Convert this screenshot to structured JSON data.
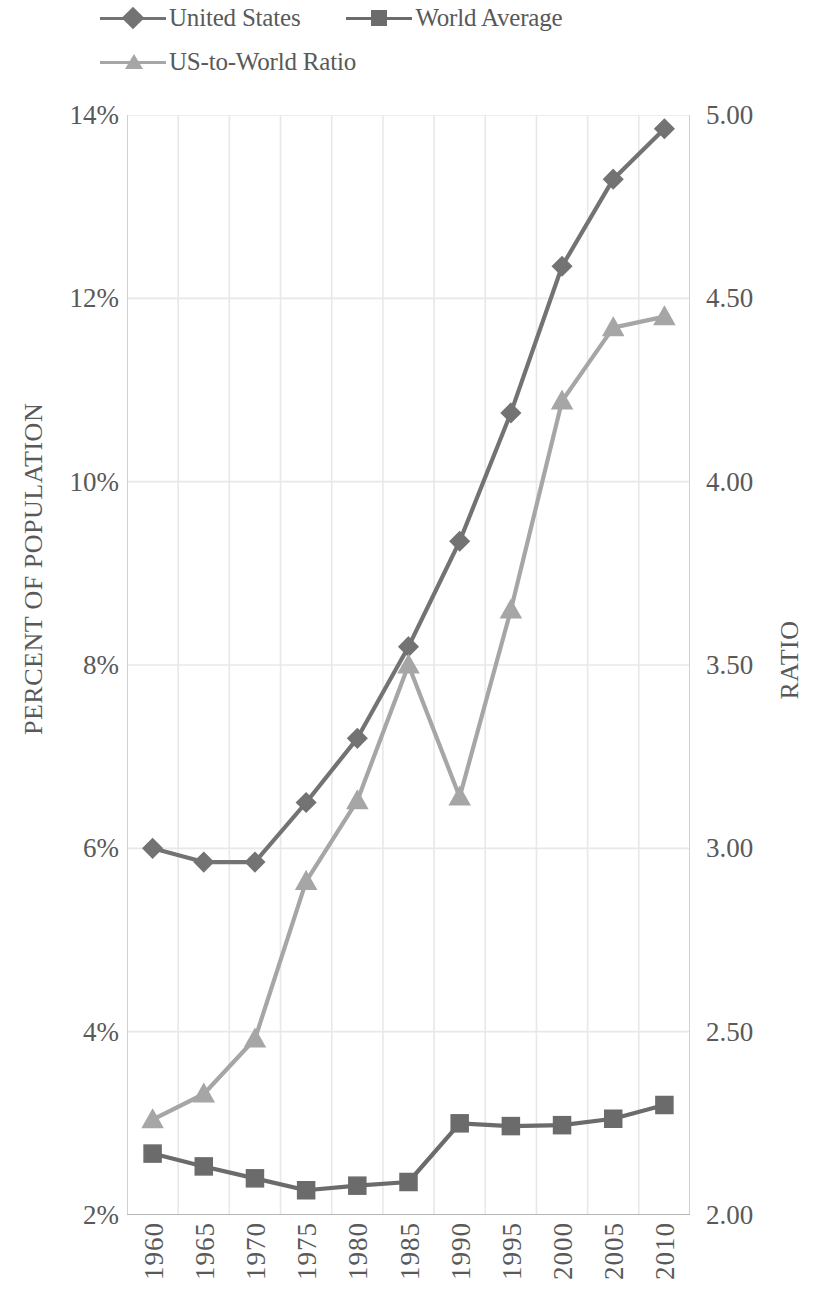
{
  "legend": {
    "entries": [
      {
        "label": "United States",
        "marker": "diamond-marker-icon",
        "color": "#737373"
      },
      {
        "label": "World Average",
        "marker": "square-marker-icon",
        "color": "#6b6b6b"
      },
      {
        "label": "US-to-World Ratio",
        "marker": "triangle-marker-icon",
        "color": "#a6a6a6"
      }
    ]
  },
  "axes": {
    "left_title": "PERCENT OF POPULATION",
    "right_title": "RATIO",
    "left_ticks": [
      "14%",
      "12%",
      "10%",
      "8%",
      "6%",
      "4%",
      "2%"
    ],
    "right_ticks": [
      "5.00",
      "4.50",
      "4.00",
      "3.50",
      "3.00",
      "2.50",
      "2.00"
    ],
    "x_ticks": [
      "1960",
      "1965",
      "1970",
      "1975",
      "1980",
      "1985",
      "1990",
      "1995",
      "2000",
      "2005",
      "2010"
    ]
  },
  "chart_data": {
    "type": "line",
    "title": "",
    "xlabel": "",
    "ylabel": "PERCENT OF POPULATION",
    "y2label": "RATIO",
    "grid": true,
    "legend_position": "top-left",
    "x": [
      1960,
      1965,
      1970,
      1975,
      1980,
      1985,
      1990,
      1995,
      2000,
      2005,
      2010
    ],
    "ylim": [
      2,
      14
    ],
    "y2lim": [
      2.0,
      5.0
    ],
    "series": [
      {
        "name": "United States",
        "axis": "left",
        "units": "percent",
        "marker": "diamond",
        "color": "#737373",
        "values": [
          6.0,
          5.85,
          5.85,
          6.5,
          7.2,
          8.2,
          9.35,
          10.75,
          12.35,
          13.3,
          13.85
        ]
      },
      {
        "name": "World Average",
        "axis": "left",
        "units": "percent",
        "marker": "square",
        "color": "#6b6b6b",
        "values": [
          2.67,
          2.53,
          2.4,
          2.27,
          2.32,
          2.36,
          3.0,
          2.97,
          2.98,
          3.05,
          3.2
        ]
      },
      {
        "name": "US-to-World Ratio",
        "axis": "right",
        "units": "ratio",
        "marker": "triangle",
        "color": "#a6a6a6",
        "values": [
          2.26,
          2.33,
          2.48,
          2.91,
          3.13,
          3.5,
          3.14,
          3.65,
          4.22,
          4.42,
          4.45
        ]
      }
    ]
  },
  "style": {
    "grid_color": "#e8e8e8",
    "text_color": "#595959",
    "background": "#ffffff"
  }
}
